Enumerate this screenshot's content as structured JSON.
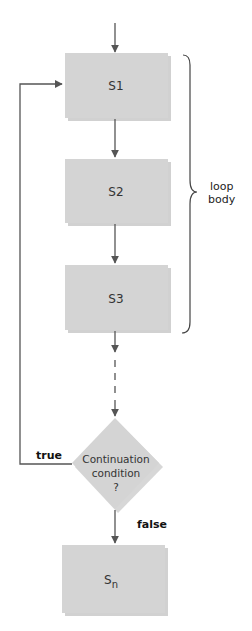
{
  "diagram": {
    "type": "flowchart",
    "colors": {
      "box_fill": "#d4d4d4",
      "shadow": "#b5b5b5",
      "line": "#555555",
      "background": "#ffffff"
    },
    "nodes": [
      {
        "id": "s1",
        "shape": "rect",
        "label": "S1"
      },
      {
        "id": "s2",
        "shape": "rect",
        "label": "S2"
      },
      {
        "id": "s3",
        "shape": "rect",
        "label": "S3"
      },
      {
        "id": "cond",
        "shape": "diamond",
        "label_lines": [
          "Continuation",
          "condition",
          "?"
        ]
      },
      {
        "id": "sn",
        "shape": "rect",
        "label_main": "S",
        "label_sub": "n"
      }
    ],
    "edges": [
      {
        "from": "start",
        "to": "s1",
        "style": "solid"
      },
      {
        "from": "s1",
        "to": "s2",
        "style": "solid"
      },
      {
        "from": "s2",
        "to": "s3",
        "style": "solid"
      },
      {
        "from": "s3",
        "to": "cond",
        "style": "dashed"
      },
      {
        "from": "cond",
        "to": "s1",
        "label": "true",
        "style": "solid"
      },
      {
        "from": "cond",
        "to": "sn",
        "label": "false",
        "style": "solid"
      }
    ],
    "brace": {
      "spans": [
        "s1",
        "s2",
        "s3"
      ],
      "label_lines": [
        "loop",
        "body"
      ]
    },
    "branch_labels": {
      "true": "true",
      "false": "false"
    }
  }
}
